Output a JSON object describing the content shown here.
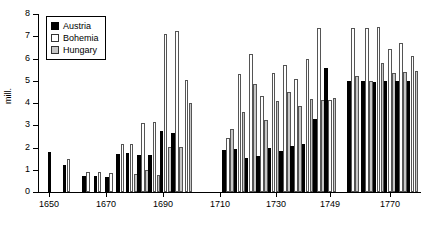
{
  "chart_data": {
    "type": "bar",
    "title": "",
    "xlabel": "",
    "ylabel": "mill.",
    "ylim": [
      0,
      8
    ],
    "ytick_labels": [
      "0",
      "1",
      "2",
      "3",
      "4",
      "5",
      "6",
      "7",
      "8"
    ],
    "ytick_values": [
      0,
      1,
      2,
      3,
      4,
      5,
      6,
      7,
      8
    ],
    "xtick_labels": [
      "1650",
      "1670",
      "1690",
      "1710",
      "1730",
      "1749",
      "1770"
    ],
    "xtick_values": [
      1650,
      1670,
      1690,
      1710,
      1730,
      1749,
      1770
    ],
    "grid": false,
    "legend_position": "top-left",
    "legend": [
      "Austria",
      "Bohemia",
      "Hungary"
    ],
    "colors": {
      "Austria": "#000000",
      "Bohemia": "#ffffff",
      "Hungary": "#c6c6c6",
      "outline": "#555555",
      "axis": "#000000"
    },
    "categories": [
      1650,
      1656,
      1663,
      1667,
      1671,
      1675,
      1679,
      1683,
      1687,
      1691,
      1695,
      1699,
      1713,
      1717,
      1721,
      1725,
      1729,
      1733,
      1737,
      1741,
      1745,
      1749,
      1757,
      1762,
      1766,
      1770,
      1774,
      1778
    ],
    "series": [
      {
        "name": "Austria",
        "values": [
          1.8,
          1.22,
          0.72,
          0.72,
          0.67,
          1.73,
          1.75,
          1.66,
          1.68,
          2.75,
          2.65,
          null,
          1.9,
          1.92,
          1.55,
          1.6,
          2.0,
          1.85,
          2.05,
          2.18,
          3.3,
          5.58,
          5.0,
          5.0,
          4.95,
          5.0,
          5.0,
          4.98
        ]
      },
      {
        "name": "Bohemia",
        "values": [
          null,
          1.48,
          0.88,
          0.9,
          0.85,
          2.17,
          2.17,
          3.12,
          3.15,
          7.1,
          7.25,
          5.02,
          2.45,
          5.32,
          6.22,
          4.3,
          5.33,
          5.7,
          5.08,
          5.98,
          7.38,
          4.15,
          7.35,
          7.38,
          7.4,
          6.45,
          6.7,
          6.12
        ]
      },
      {
        "name": "Hungary",
        "values": [
          null,
          null,
          null,
          null,
          null,
          null,
          0.8,
          1.0,
          0.78,
          2.02,
          2.02,
          3.98,
          2.85,
          3.6,
          4.85,
          3.25,
          4.1,
          4.5,
          3.85,
          4.2,
          4.15,
          4.22,
          5.22,
          5.0,
          5.8,
          5.35,
          5.4,
          5.45
        ]
      }
    ]
  }
}
